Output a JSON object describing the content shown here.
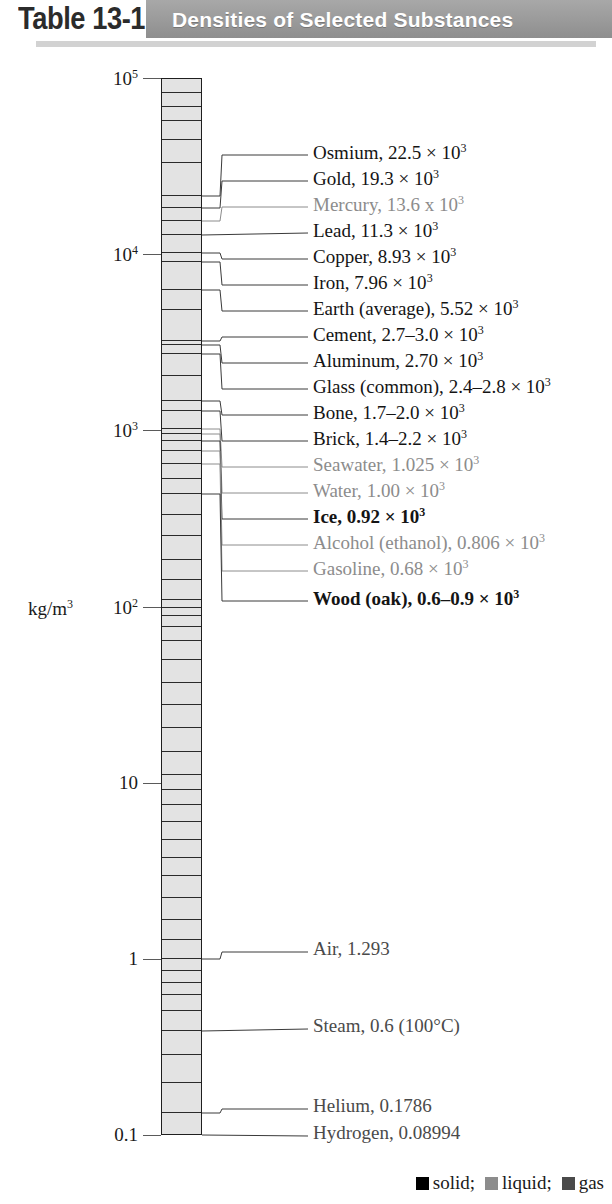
{
  "header": {
    "table_number": "Table 13-1",
    "title": "Densities of Selected Substances",
    "band_color": "#9a9a9a",
    "title_color": "#ffffff"
  },
  "axis": {
    "unit_label_html": "kg/m<sup>3</sup>",
    "unit_label": "kg/m3",
    "ticks": [
      {
        "label_html": "10<sup>5</sup>",
        "label": "10^5",
        "value": 100000
      },
      {
        "label_html": "10<sup>4</sup>",
        "label": "10^4",
        "value": 10000
      },
      {
        "label_html": "10<sup>3</sup>",
        "label": "10^3",
        "value": 1000
      },
      {
        "label_html": "10<sup>2</sup>",
        "label": "10^2",
        "value": 100
      },
      {
        "label_html": "10",
        "label": "10",
        "value": 10
      },
      {
        "label_html": "1",
        "label": "1",
        "value": 1
      },
      {
        "label_html": "0.1",
        "label": "0.1",
        "value": 0.1
      }
    ],
    "top_value": 100000,
    "bottom_value": 0.1,
    "scale": "logarithmic"
  },
  "chart_data": {
    "type": "bar",
    "title": "Densities of Selected Substances",
    "ylabel": "kg/m3",
    "ylim": [
      0.1,
      100000
    ],
    "yscale": "log",
    "categories": [
      "Osmium",
      "Gold",
      "Mercury",
      "Lead",
      "Copper",
      "Iron",
      "Earth (average)",
      "Cement",
      "Aluminum",
      "Glass (common)",
      "Bone",
      "Brick",
      "Seawater",
      "Water",
      "Ice",
      "Alcohol (ethanol)",
      "Gasoline",
      "Wood (oak)",
      "Air",
      "Steam",
      "Helium",
      "Hydrogen"
    ],
    "values": [
      22500,
      19300,
      13600,
      11300,
      8930,
      7960,
      5520,
      2850,
      2700,
      2600,
      1850,
      1800,
      1025,
      1000,
      920,
      806,
      680,
      750,
      1.293,
      0.6,
      0.1786,
      0.08994
    ]
  },
  "substances": [
    {
      "name": "Osmium",
      "value_html": "22.5 &times; 10<sup>3</sup>",
      "value": "22.5 x 10^3",
      "state": "solid",
      "bold": false,
      "density": 22500,
      "label_y": 155,
      "anchor_y": 196
    },
    {
      "name": "Gold",
      "value_html": "19.3 &times; 10<sup>3</sup>",
      "value": "19.3 x 10^3",
      "state": "solid",
      "bold": false,
      "density": 19300,
      "label_y": 181,
      "anchor_y": 208
    },
    {
      "name": "Mercury",
      "value_html": "13.6 x 10<sup>3</sup>",
      "value": "13.6 x 10^3",
      "state": "liquid",
      "bold": false,
      "density": 13600,
      "label_y": 207,
      "anchor_y": 221
    },
    {
      "name": "Lead",
      "value_html": "11.3 &times; 10<sup>3</sup>",
      "value": "11.3 x 10^3",
      "state": "solid",
      "bold": false,
      "density": 11300,
      "label_y": 233,
      "anchor_y": 235
    },
    {
      "name": "Copper",
      "value_html": "8.93 &times; 10<sup>3</sup>",
      "value": "8.93 x 10^3",
      "state": "solid",
      "bold": false,
      "density": 8930,
      "label_y": 259,
      "anchor_y": 253
    },
    {
      "name": "Iron",
      "value_html": "7.96 &times; 10<sup>3</sup>",
      "value": "7.96 x 10^3",
      "state": "solid",
      "bold": false,
      "density": 7960,
      "label_y": 285,
      "anchor_y": 262
    },
    {
      "name": "Earth (average)",
      "value_html": "5.52 &times; 10<sup>3</sup>",
      "value": "5.52 x 10^3",
      "state": "solid",
      "bold": false,
      "density": 5520,
      "label_y": 311,
      "anchor_y": 290
    },
    {
      "name": "Cement",
      "value_html": "2.7&ndash;3.0 &times; 10<sup>3</sup>",
      "value": "2.7-3.0 x 10^3",
      "state": "solid",
      "bold": false,
      "density": 2850,
      "label_y": 337,
      "anchor_y": 341
    },
    {
      "name": "Aluminum",
      "value_html": "2.70 &times; 10<sup>3</sup>",
      "value": "2.70 x 10^3",
      "state": "solid",
      "bold": false,
      "density": 2700,
      "label_y": 363,
      "anchor_y": 345
    },
    {
      "name": "Glass (common)",
      "value_html": "2.4&ndash;2.8 &times; 10<sup>3</sup>",
      "value": "2.4-2.8 x 10^3",
      "state": "solid",
      "bold": false,
      "density": 2600,
      "label_y": 389,
      "anchor_y": 354
    },
    {
      "name": "Bone",
      "value_html": "1.7&ndash;2.0 &times; 10<sup>3</sup>",
      "value": "1.7-2.0 x 10^3",
      "state": "solid",
      "bold": false,
      "density": 1850,
      "label_y": 415,
      "anchor_y": 401
    },
    {
      "name": "Brick",
      "value_html": "1.4&ndash;2.2 &times; 10<sup>3</sup>",
      "value": "1.4-2.2 x 10^3",
      "state": "solid",
      "bold": false,
      "density": 1800,
      "label_y": 441,
      "anchor_y": 411
    },
    {
      "name": "Seawater",
      "value_html": "1.025 &times; 10<sup>3</sup>",
      "value": "1.025 x 10^3",
      "state": "liquid",
      "bold": false,
      "density": 1025,
      "label_y": 467,
      "anchor_y": 429
    },
    {
      "name": "Water",
      "value_html": "1.00 &times; 10<sup>3</sup>",
      "value": "1.00 x 10^3",
      "state": "liquid",
      "bold": false,
      "density": 1000,
      "label_y": 493,
      "anchor_y": 434
    },
    {
      "name": "Ice",
      "value_html": "0.92 &times; 10<sup>3</sup>",
      "value": "0.92 x 10^3",
      "state": "solid",
      "bold": true,
      "density": 920,
      "label_y": 519,
      "anchor_y": 441
    },
    {
      "name": "Alcohol (ethanol)",
      "value_html": "0.806 &times; 10<sup>3</sup>",
      "value": "0.806 x 10^3",
      "state": "liquid",
      "bold": false,
      "density": 806,
      "label_y": 545,
      "anchor_y": 451
    },
    {
      "name": "Gasoline",
      "value_html": "0.68 &times; 10<sup>3</sup>",
      "value": "0.68 x 10^3",
      "state": "liquid",
      "bold": false,
      "density": 680,
      "label_y": 571,
      "anchor_y": 464
    },
    {
      "name": "Wood (oak)",
      "value_html": "0.6&ndash;0.9 &times; 10<sup>3</sup>",
      "value": "0.6-0.9 x 10^3",
      "state": "solid",
      "bold": true,
      "density": 750,
      "label_y": 601,
      "anchor_y": 494
    },
    {
      "name": "Air",
      "value_html": "1.293",
      "value": "1.293",
      "state": "gas",
      "bold": false,
      "density": 1.293,
      "label_y": 952,
      "anchor_y": 959
    },
    {
      "name": "Steam",
      "value_html": "0.6 (100&deg;C)",
      "value": "0.6 (100C)",
      "state": "gas",
      "bold": false,
      "density": 0.6,
      "label_y": 1029,
      "anchor_y": 1031
    },
    {
      "name": "Helium",
      "value_html": "0.1786",
      "value": "0.1786",
      "state": "gas",
      "bold": false,
      "density": 0.1786,
      "label_y": 1109,
      "anchor_y": 1113
    },
    {
      "name": "Hydrogen",
      "value_html": "0.08994",
      "value": "0.08994",
      "state": "gas",
      "bold": false,
      "density": 0.08994,
      "label_y": 1136,
      "anchor_y": 1135
    }
  ],
  "legend": {
    "separator": ";",
    "items": [
      {
        "label": "solid",
        "color": "#000000"
      },
      {
        "label": "liquid",
        "color": "#8c8c8c"
      },
      {
        "label": "gas",
        "color": "#4a4a4a"
      }
    ]
  },
  "segment_lines_y": [
    93,
    107,
    121,
    140,
    163,
    196,
    208,
    221,
    235,
    253,
    262,
    290,
    310,
    341,
    345,
    354,
    376,
    401,
    411,
    429,
    434,
    441,
    451,
    464,
    479,
    494,
    515,
    536,
    560,
    580,
    600,
    608,
    616,
    627,
    641,
    660,
    683,
    705,
    728,
    752,
    775,
    790,
    805,
    822,
    840,
    858,
    876,
    898,
    920,
    940,
    959,
    971,
    983,
    995,
    1011,
    1031,
    1055,
    1083,
    1113
  ]
}
